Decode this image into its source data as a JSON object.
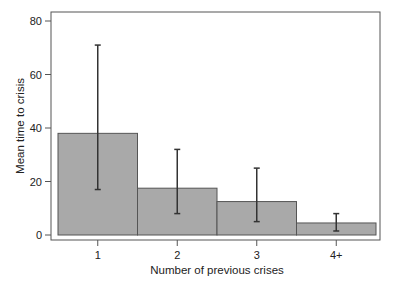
{
  "chart_data": {
    "type": "bar",
    "title": "",
    "xlabel": "Number of previous crises",
    "ylabel": "Mean time to crisis",
    "categories": [
      "1",
      "2",
      "3",
      "4+"
    ],
    "values": [
      38,
      17.5,
      12.5,
      4.5
    ],
    "error_bars": {
      "lower": [
        17,
        8,
        5,
        1.5
      ],
      "upper": [
        71,
        32,
        25,
        8
      ]
    },
    "ylim": [
      0,
      80
    ],
    "yticks": [
      0,
      20,
      40,
      60,
      80
    ],
    "grid": false,
    "legend": null,
    "colors": {
      "bar_fill": "#a9a9a9",
      "bar_stroke": "#555555",
      "error_bar": "#333333",
      "frame": "#555555"
    }
  }
}
